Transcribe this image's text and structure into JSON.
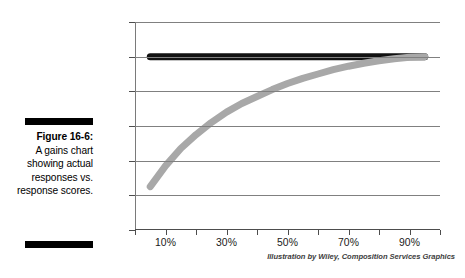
{
  "caption": {
    "figure_number": "Figure 16-6:",
    "text": "A gains chart showing actual responses vs. response scores."
  },
  "credit": "Illustration by Wiley, Composition Services Graphics",
  "colors": {
    "actual_line": "#111111",
    "score_curve": "#a8a8a8",
    "grid": "#808080",
    "axis": "#4d4d4d",
    "background": "#ffffff"
  },
  "chart_data": {
    "type": "line",
    "title": "",
    "subtitle": "",
    "xlabel": "",
    "ylabel": "",
    "xlim": [
      0,
      100
    ],
    "ylim": [
      0,
      120
    ],
    "grid": true,
    "legend": "none",
    "y_ticks": [
      "0%",
      "20%",
      "40%",
      "60%",
      "80%",
      "100%",
      "120%"
    ],
    "y_tick_values": [
      0,
      20,
      40,
      60,
      80,
      100,
      120
    ],
    "x_ticks": [
      "10%",
      "30%",
      "50%",
      "70%",
      "90%"
    ],
    "x_tick_values": [
      10,
      30,
      50,
      70,
      90
    ],
    "x_minor_tick_values": [
      0,
      20,
      40,
      60,
      80,
      100
    ],
    "x": [
      5,
      10,
      15,
      20,
      25,
      30,
      35,
      40,
      45,
      50,
      55,
      60,
      65,
      70,
      75,
      80,
      85,
      90,
      95
    ],
    "series": [
      {
        "name": "Actual responses",
        "color": "#111111",
        "width": 7,
        "values": [
          100,
          100,
          100,
          100,
          100,
          100,
          100,
          100,
          100,
          100,
          100,
          100,
          100,
          100,
          100,
          100,
          100,
          100,
          100
        ]
      },
      {
        "name": "Response scores",
        "color": "#a8a8a8",
        "width": 7,
        "values": [
          25,
          37,
          47,
          55,
          62,
          68,
          73,
          77,
          81,
          84.5,
          87.5,
          90,
          92.5,
          94.5,
          96.2,
          97.6,
          98.8,
          99.6,
          100
        ]
      }
    ]
  }
}
